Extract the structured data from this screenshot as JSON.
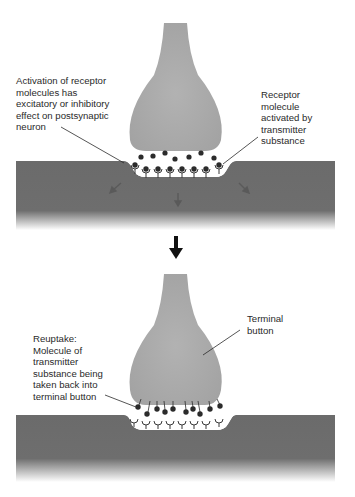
{
  "colors": {
    "terminal_button": "#a9a9a9",
    "postsynaptic_membrane": "#6c6c6c",
    "molecule": "#2b2b2b",
    "arrow": "#1a1a1a",
    "background": "#ffffff"
  },
  "panel_top": {
    "label_left": {
      "lines": [
        "Activation of receptor",
        "molecules has",
        "excitatory or inhibitory",
        "effect on postsynaptic",
        "neuron"
      ]
    },
    "label_right": {
      "lines": [
        "Receptor",
        "molecule",
        "activated by",
        "transmitter",
        "substance"
      ]
    },
    "receptor_count": 8,
    "free_molecule_count": 7
  },
  "transition_arrow": {
    "icon": "down-arrow-icon"
  },
  "panel_bottom": {
    "label_left": {
      "lines": [
        "Reuptake:",
        "Molecule of",
        "transmitter",
        "substance being",
        "taken back into",
        "terminal button"
      ]
    },
    "label_right": {
      "lines": [
        "Terminal",
        "button"
      ]
    },
    "receptor_count": 8,
    "reuptake_molecule_count": 11
  }
}
